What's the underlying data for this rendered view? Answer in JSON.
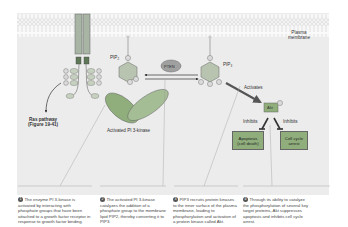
{
  "diagram": {
    "membrane_label_line1": "Plasma",
    "membrane_label_line2": "membrane",
    "pten_label": "PTEN",
    "pip2_label": "PIP",
    "pip2_sub": "2",
    "pip3_label": "PIP",
    "pip3_sub": "3",
    "phosphate_label": "P",
    "activates_label": "Activates",
    "akt_label": "Akt",
    "inhibits_left": "Inhibits",
    "inhibits_right": "Inhibits",
    "apoptosis_line1": "Apoptosis",
    "apoptosis_line2": "(cell death)",
    "cellcycle_line1": "Cell cycle",
    "cellcycle_line2": "arrest",
    "ras_line1": "Ras pathway",
    "ras_line2": "(Figure 19-41)",
    "pi3k_label": "Activated PI 3-kinase",
    "colors": {
      "receptor": "#a8b4a4",
      "pi3k": "#8fae7c",
      "pten": "#a0a0a0",
      "hexagon": "#b8c4b0",
      "phosphate": "#dadada",
      "akt": "#8fae7c"
    }
  },
  "captions": [
    {
      "num": "1",
      "text": "The enzyme PI 3-kinase is activated by interacting with phosphate groups that have been attached to a growth factor receptor in response to growth factor binding."
    },
    {
      "num": "2",
      "text": "The activated PI 3-kinase catalyzes the addition of a phosphate group to the membrane lipid PIP2, thereby converting it to PIP3."
    },
    {
      "num": "3",
      "text": "PIP3 recruits protein kinases to the inner surface of the plasma membrane, leading to phosphorylation and activation of a protein kinase called Akt."
    },
    {
      "num": "4",
      "text": "Through its ability to catalyze the phosphorylation of several key target proteins, Akt suppresses apoptosis and inhibits cell cycle arrest."
    }
  ]
}
